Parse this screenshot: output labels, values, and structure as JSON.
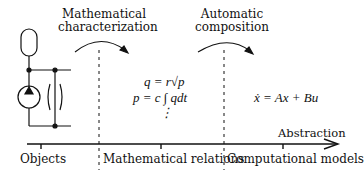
{
  "steps": {
    "step1": {
      "line1": "Mathematical",
      "line2": "characterization"
    },
    "step2": {
      "line1": "Automatic",
      "line2": "composition"
    }
  },
  "equations": {
    "eq1": "q = r√p",
    "eq2": "p = c ∫ qdt",
    "ellipsis": "⋮",
    "state_space": "ẋ = Ax + Bu"
  },
  "axis": {
    "label": "Abstraction",
    "ticks": [
      "Objects",
      "Mathematical relations",
      "Computational models"
    ]
  },
  "icons": {
    "circuit": "hydraulic-circuit-icon"
  }
}
